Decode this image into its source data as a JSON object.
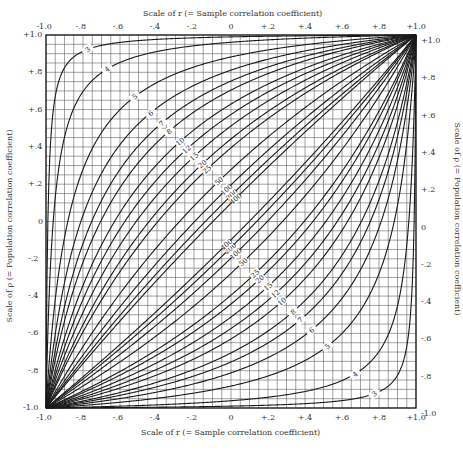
{
  "chart_data": {
    "type": "line",
    "title": "",
    "xlabel": "Scale of r (= Sample correlation coefficient)",
    "ylabel": "Scale of ρ (= Population correlation coefficient)",
    "xlim": [
      -1.0,
      1.0
    ],
    "ylim": [
      -1.0,
      1.0
    ],
    "x_ticks": [
      "-1.0",
      "-.8",
      "-.6",
      "-.4",
      "-.2",
      "0",
      "+.2",
      "+.4",
      "+.6",
      "+.8",
      "+1.0"
    ],
    "y_ticks": [
      "+1.0",
      "+.8",
      "+.6",
      "+.4",
      "+.2",
      "0",
      "-.2",
      "-.4",
      "-.6",
      "-.8",
      "-1.0"
    ],
    "grid": true,
    "grid_step": 0.05,
    "confidence_z": 1.96,
    "series_sample_sizes": [
      3,
      4,
      5,
      6,
      7,
      8,
      10,
      12,
      15,
      20,
      25,
      50,
      100,
      200,
      400
    ],
    "series": [
      {
        "name": "n=3 upper",
        "points": [
          [
            -1.0,
            -1.0
          ],
          [
            -0.9,
            0.55
          ],
          [
            -0.8,
            0.78
          ],
          [
            -0.6,
            0.88
          ],
          [
            -0.2,
            0.94
          ],
          [
            0.2,
            0.96
          ],
          [
            0.6,
            0.98
          ],
          [
            1.0,
            1.0
          ]
        ]
      },
      {
        "name": "n=4 upper",
        "points": [
          [
            -1.0,
            -1.0
          ],
          [
            -0.8,
            0.33
          ],
          [
            -0.6,
            0.58
          ],
          [
            -0.4,
            0.73
          ],
          [
            0,
            0.88
          ],
          [
            0.4,
            0.95
          ],
          [
            1.0,
            1.0
          ]
        ]
      },
      {
        "name": "n=5 upper",
        "points": [
          [
            -1.0,
            -1.0
          ],
          [
            -0.8,
            0.13
          ],
          [
            -0.6,
            0.38
          ],
          [
            -0.4,
            0.56
          ],
          [
            0,
            0.8
          ],
          [
            0.4,
            0.92
          ],
          [
            1.0,
            1.0
          ]
        ]
      },
      {
        "name": "n=10 upper",
        "points": [
          [
            -1.0,
            -1.0
          ],
          [
            -0.6,
            0.08
          ],
          [
            -0.4,
            0.3
          ],
          [
            0,
            0.63
          ],
          [
            0.4,
            0.83
          ],
          [
            1.0,
            1.0
          ]
        ]
      },
      {
        "name": "n=25 upper",
        "points": [
          [
            -1.0,
            -1.0
          ],
          [
            -0.6,
            -0.24
          ],
          [
            -0.4,
            -0.01
          ],
          [
            0,
            0.39
          ],
          [
            0.4,
            0.7
          ],
          [
            1.0,
            1.0
          ]
        ]
      },
      {
        "name": "n=100 upper",
        "points": [
          [
            -1.0,
            -1.0
          ],
          [
            -0.6,
            -0.46
          ],
          [
            -0.4,
            -0.22
          ],
          [
            0,
            0.2
          ],
          [
            0.4,
            0.55
          ],
          [
            1.0,
            1.0
          ]
        ]
      },
      {
        "name": "n=400 upper",
        "points": [
          [
            -1.0,
            -1.0
          ],
          [
            -0.6,
            -0.53
          ],
          [
            -0.4,
            -0.31
          ],
          [
            0,
            0.1
          ],
          [
            0.4,
            0.48
          ],
          [
            1.0,
            1.0
          ]
        ]
      }
    ],
    "symmetry_note": "Lower curves are the point reflection of upper curves through the origin",
    "upper_labels": [
      "3",
      "4",
      "5",
      "6",
      "7",
      "8",
      "10",
      "12",
      "15",
      "20",
      "25",
      "50",
      "100",
      "200",
      "400"
    ],
    "lower_labels": [
      "400",
      "200",
      "100",
      "50",
      "25",
      "20",
      "15",
      "12",
      "10",
      "8",
      "7",
      "6",
      "5",
      "4",
      "3"
    ]
  },
  "axes": {
    "top_title": "Scale of r (= Sample correlation coefficient)",
    "bottom_title": "Scale of r (= Sample correlation coefficient)",
    "left_title": "Scale of ρ (= Population correlation coefficient)",
    "right_title": "Scale of ρ (= Population correlation coefficient)"
  }
}
